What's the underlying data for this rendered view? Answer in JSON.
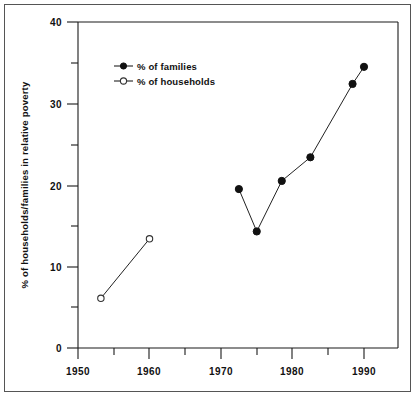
{
  "chart_data": {
    "type": "line",
    "title": "",
    "xlabel": "",
    "ylabel": "% of households/families in relative poverty",
    "xlim": [
      1948,
      1994
    ],
    "ylim": [
      0,
      40
    ],
    "grid": false,
    "legend_position": "top-left",
    "x_ticks_major": [
      1950,
      1960,
      1970,
      1980,
      1990
    ],
    "x_ticks_minor": [
      1955,
      1965,
      1975,
      1985
    ],
    "y_ticks_major": [
      0,
      10,
      20,
      30,
      40
    ],
    "y_ticks_minor": [
      5,
      15,
      25,
      35
    ],
    "series": [
      {
        "name": "% of families",
        "marker": "filled-circle",
        "x": [
          1972.5,
          1975,
          1978.5,
          1982.5,
          1988.4,
          1990
        ],
        "values": [
          19.5,
          14.3,
          20.5,
          23.4,
          32.4,
          34.5
        ]
      },
      {
        "name": "% of households",
        "marker": "open-circle",
        "x": [
          1953.2,
          1960
        ],
        "values": [
          6.1,
          13.4
        ]
      }
    ]
  },
  "axes": {
    "y_label": "% of households/families in relative poverty",
    "y_tick_labels": [
      "40",
      "30",
      "20",
      "10",
      "0"
    ],
    "x_tick_labels": [
      "1950",
      "1960",
      "1970",
      "1980",
      "1990"
    ]
  },
  "legend": {
    "items": [
      {
        "label": "% of families",
        "marker": "filled-circle"
      },
      {
        "label": "% of households",
        "marker": "open-circle"
      }
    ]
  },
  "colors": {
    "ink": "#111111",
    "line": "#222222",
    "frame": "#555555",
    "background": "#ffffff"
  }
}
